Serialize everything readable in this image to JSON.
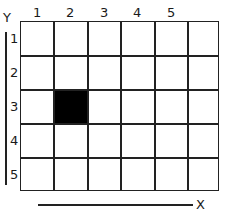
{
  "diagram": {
    "columns": 6,
    "rows": 5,
    "x_labels": [
      "1",
      "2",
      "3",
      "4",
      "5"
    ],
    "y_labels": [
      "1",
      "2",
      "3",
      "4",
      "5"
    ],
    "x_axis_label": "X",
    "y_axis_label": "Y",
    "filled_cells": [
      {
        "col": 2,
        "row": 3,
        "color": "#000000"
      }
    ],
    "line_color": "#222222",
    "background": "#ffffff"
  }
}
